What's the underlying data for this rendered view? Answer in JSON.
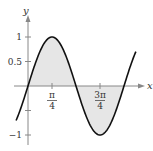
{
  "chart_data": {
    "type": "line",
    "title": "",
    "function": "y = sin(2x)",
    "xlabel": "x",
    "ylabel": "y",
    "xlim": [
      -0.39,
      3.53
    ],
    "ylim": [
      -1.15,
      1.2
    ],
    "grid": false,
    "x_ticks": [
      {
        "value": 0.7854,
        "label_num": "π",
        "label_den": "4"
      },
      {
        "value": 2.3562,
        "label_num": "3π",
        "label_den": "4"
      }
    ],
    "y_ticks": [
      {
        "value": 1,
        "label": "1"
      },
      {
        "value": 0.5,
        "label": "0.5"
      },
      {
        "value": -0.5,
        "label": ""
      },
      {
        "value": -1,
        "label": "−1"
      }
    ],
    "series": [
      {
        "name": "sin(2x)",
        "x": [
          -0.39,
          0,
          0.3927,
          0.7854,
          1.1781,
          1.5708,
          1.9635,
          2.3562,
          2.7489,
          3.1416,
          3.53
        ],
        "values": [
          -0.7,
          0,
          0.707,
          1,
          0.707,
          0,
          -0.707,
          -1,
          -0.707,
          0,
          0.7
        ]
      }
    ],
    "shaded_regions": [
      {
        "from": 0,
        "to": 1.5708,
        "between": "curve and x-axis",
        "color": "#e6e6e6"
      },
      {
        "from": 1.5708,
        "to": 3.1416,
        "between": "curve and x-axis",
        "color": "#e6e6e6"
      }
    ],
    "colors": {
      "curve": "#111111",
      "axis": "#888888",
      "shade": "#e6e6e6"
    }
  }
}
